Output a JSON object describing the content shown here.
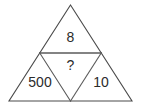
{
  "figure": {
    "shape": "equilateral-triangle-divided-into-four",
    "stroke_color": "#4a4a4a",
    "text_color": "#2b2b2b",
    "background_color": "#ffffff"
  },
  "regions": {
    "top": {
      "name": "top-sub-triangle",
      "label": "8",
      "orientation": "upright"
    },
    "middle": {
      "name": "center-sub-triangle",
      "label": "?",
      "orientation": "inverted"
    },
    "bottom_left": {
      "name": "bottom-left-sub-triangle",
      "label": "500",
      "orientation": "upright"
    },
    "bottom_right": {
      "name": "bottom-right-sub-triangle",
      "label": "10",
      "orientation": "upright"
    }
  },
  "geometry": {
    "apex": "70.5,5",
    "bottom_left": "9,101",
    "bottom_right": "132,101",
    "mid_left": "39.75,53",
    "mid_right": "101.25,53",
    "mid_bottom": "70.5,101",
    "outer_outline": "70.5,5 132,101 9,101",
    "midline": "39.75,53 101.25,53",
    "left_inner_edge": "39.75,53 70.5,101",
    "right_inner_edge": "101.25,53 70.5,101"
  },
  "label_positions": {
    "top": {
      "x": "70.5",
      "y": "38"
    },
    "middle": {
      "x": "70.5",
      "y": "66"
    },
    "bottom_left": {
      "x": "40",
      "y": "83"
    },
    "bottom_right": {
      "x": "101",
      "y": "83"
    }
  }
}
